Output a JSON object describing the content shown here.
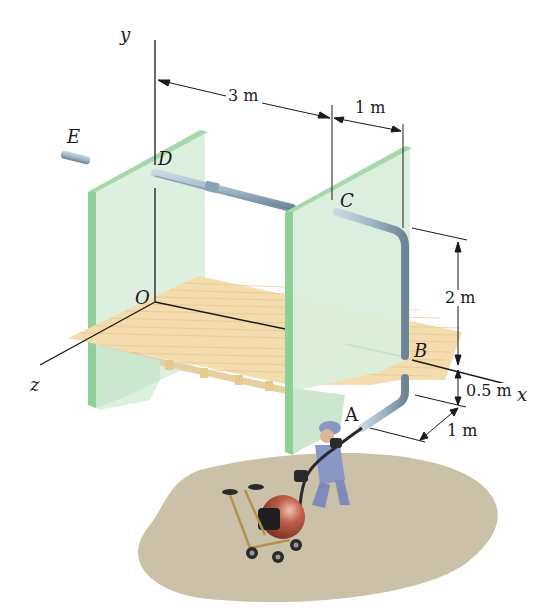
{
  "figure": {
    "axes": {
      "x": "x",
      "y": "y",
      "z": "z",
      "origin": "O"
    },
    "points": {
      "A": "A",
      "B": "B",
      "C": "C",
      "D": "D",
      "E": "E"
    },
    "dimensions": {
      "dx_DC": "3 m",
      "dx_CB": "1 m",
      "dy_CB": "2 m",
      "dy_BA": "0.5 m",
      "dz_A": "1 m"
    },
    "colors": {
      "wall": "#cfe8d2",
      "wall_edge": "#7fc48a",
      "floor": "#f3d9a8",
      "pipe": "#9fb6c6",
      "ground": "#c9bfa6",
      "ball": "#b5523f",
      "worker": "#8a96c4"
    }
  }
}
